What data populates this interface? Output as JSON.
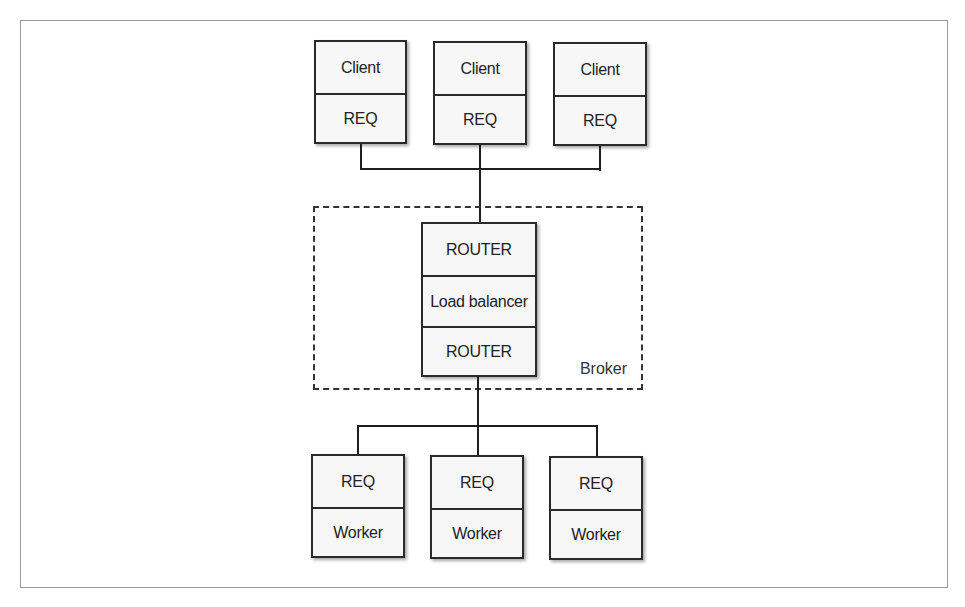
{
  "diagram": {
    "clients": [
      {
        "top": "Client",
        "bottom": "REQ"
      },
      {
        "top": "Client",
        "bottom": "REQ"
      },
      {
        "top": "Client",
        "bottom": "REQ"
      }
    ],
    "broker": {
      "label": "Broker",
      "stack": [
        "ROUTER",
        "Load balancer",
        "ROUTER"
      ]
    },
    "workers": [
      {
        "top": "REQ",
        "bottom": "Worker"
      },
      {
        "top": "REQ",
        "bottom": "Worker"
      },
      {
        "top": "REQ",
        "bottom": "Worker"
      }
    ]
  }
}
